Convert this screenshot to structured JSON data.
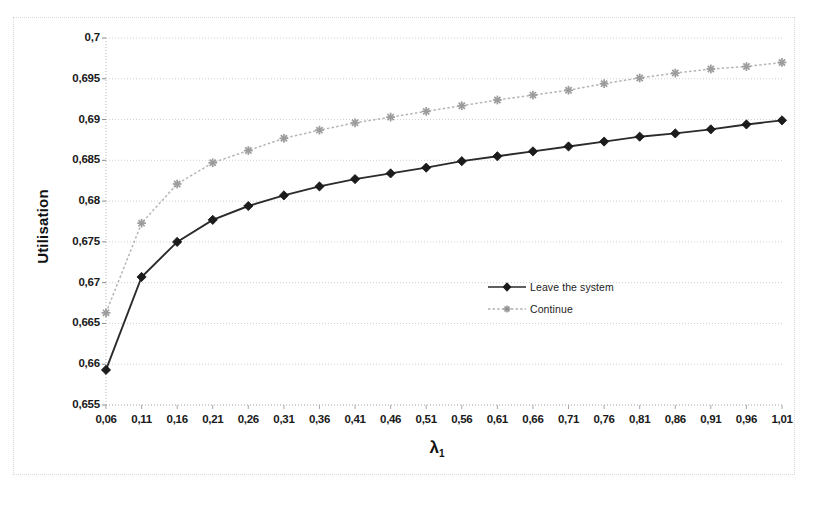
{
  "chart_data": {
    "type": "line",
    "title": "",
    "xlabel": "λ₁",
    "ylabel": "Utilisation",
    "xlim": [
      0.06,
      1.01
    ],
    "ylim": [
      0.655,
      0.7
    ],
    "grid": true,
    "legend_position": "center-right",
    "x": [
      0.06,
      0.11,
      0.16,
      0.21,
      0.26,
      0.31,
      0.36,
      0.41,
      0.46,
      0.51,
      0.56,
      0.61,
      0.66,
      0.71,
      0.76,
      0.81,
      0.86,
      0.91,
      0.96,
      1.01
    ],
    "categories": [
      "0,06",
      "0,11",
      "0,16",
      "0,21",
      "0,26",
      "0,31",
      "0,36",
      "0,41",
      "0,46",
      "0,51",
      "0,56",
      "0,61",
      "0,66",
      "0,71",
      "0,76",
      "0,81",
      "0,86",
      "0,91",
      "0,96",
      "1,01"
    ],
    "xtick_labels": [
      "0,06",
      "0,11",
      "0,16",
      "0,21",
      "0,26",
      "0,31",
      "0,36",
      "0,41",
      "0,46",
      "0,51",
      "0,56",
      "0,61",
      "0,66",
      "0,71",
      "0,76",
      "0,81",
      "0,86",
      "0,91",
      "0,96",
      "1,01"
    ],
    "ytick_labels": [
      "0,655",
      "0,66",
      "0,665",
      "0,67",
      "0,675",
      "0,68",
      "0,685",
      "0,69",
      "0,695",
      "0,7"
    ],
    "ytick_values": [
      0.655,
      0.66,
      0.665,
      0.67,
      0.675,
      0.68,
      0.685,
      0.69,
      0.695,
      0.7
    ],
    "series": [
      {
        "name": "Leave the system",
        "marker": "diamond",
        "color": "#2b2b2b",
        "line_style": "solid",
        "values": [
          0.6593,
          0.6707,
          0.675,
          0.6777,
          0.6794,
          0.6807,
          0.6818,
          0.6827,
          0.6834,
          0.6841,
          0.6849,
          0.6855,
          0.6861,
          0.6867,
          0.6873,
          0.6879,
          0.6883,
          0.6888,
          0.6894,
          0.6899
        ]
      },
      {
        "name": "Continue",
        "marker": "asterisk",
        "color": "#b5b5b5",
        "line_style": "dotted",
        "values": [
          0.6663,
          0.6773,
          0.6821,
          0.6847,
          0.6862,
          0.6877,
          0.6887,
          0.6896,
          0.6903,
          0.691,
          0.6917,
          0.6924,
          0.693,
          0.6936,
          0.6944,
          0.6951,
          0.6957,
          0.6962,
          0.6965,
          0.697
        ]
      }
    ]
  },
  "legend": {
    "items": [
      {
        "label": "Leave the system"
      },
      {
        "label": "Continue"
      }
    ]
  },
  "axes": {
    "y_title": "Utilisation",
    "x_title_base": "λ",
    "x_title_sub": "1"
  }
}
